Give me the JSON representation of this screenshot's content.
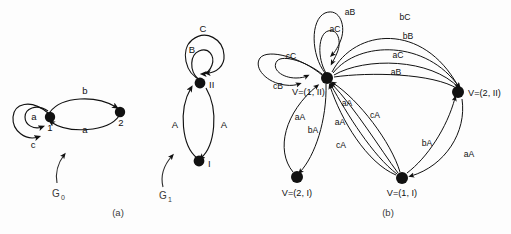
{
  "figure": {
    "background_color": "#fdfdfd",
    "ink_color": "#111111",
    "panels": [
      {
        "id": "a",
        "caption": "(a)"
      },
      {
        "id": "b",
        "caption": "(b)"
      }
    ]
  },
  "panel_a": {
    "caption": "(a)",
    "graphs": [
      {
        "name": "G",
        "subscript": "0",
        "pointer_label": "G0",
        "nodes": [
          {
            "id": "n1",
            "label": "1"
          },
          {
            "id": "n2",
            "label": "2"
          }
        ],
        "edges": [
          {
            "from": "n1",
            "to": "n1",
            "label": "a",
            "kind": "self-loop-inner"
          },
          {
            "from": "n1",
            "to": "n1",
            "label": "c",
            "kind": "self-loop-outer"
          },
          {
            "from": "n1",
            "to": "n2",
            "label": "b",
            "kind": "arc-upper"
          },
          {
            "from": "n2",
            "to": "n1",
            "label": "a",
            "kind": "arc-lower"
          }
        ]
      },
      {
        "name": "G",
        "subscript": "1",
        "pointer_label": "G1",
        "nodes": [
          {
            "id": "nII",
            "label": "II"
          },
          {
            "id": "nI",
            "label": "I"
          }
        ],
        "edges": [
          {
            "from": "nII",
            "to": "nII",
            "label": "C",
            "kind": "self-loop-outer"
          },
          {
            "from": "nII",
            "to": "nII",
            "label": "B",
            "kind": "self-loop-inner"
          },
          {
            "from": "nI",
            "to": "nII",
            "label": "A",
            "kind": "arc-left"
          },
          {
            "from": "nII",
            "to": "nI",
            "label": "A",
            "kind": "arc-right"
          }
        ]
      }
    ]
  },
  "panel_b": {
    "caption": "(b)",
    "nodes": [
      {
        "id": "v1II",
        "label": "V=(1, II)"
      },
      {
        "id": "v2II",
        "label": "V=(2, II)"
      },
      {
        "id": "v2I",
        "label": "V=(2, I)"
      },
      {
        "id": "v1I",
        "label": "V=(1, I)"
      }
    ],
    "edges": [
      {
        "from": "v1II",
        "to": "v1II",
        "label": "aB",
        "kind": "self-loop-up-outer"
      },
      {
        "from": "v1II",
        "to": "v1II",
        "label": "aC",
        "kind": "self-loop-up-inner"
      },
      {
        "from": "v1II",
        "to": "v1II",
        "label": "cC",
        "kind": "self-loop-left-inner"
      },
      {
        "from": "v1II",
        "to": "v1II",
        "label": "cB",
        "kind": "self-loop-left-outer"
      },
      {
        "from": "v1II",
        "to": "v2II",
        "label": "bC",
        "kind": "arc-top"
      },
      {
        "from": "v1II",
        "to": "v2II",
        "label": "bB",
        "kind": "arc-upper"
      },
      {
        "from": "v1II",
        "to": "v2II",
        "label": "aC",
        "kind": "arc-mid"
      },
      {
        "from": "v1II",
        "to": "v2II",
        "label": "aB",
        "kind": "arc-lower"
      },
      {
        "from": "v2I",
        "to": "v1II",
        "label": "aA",
        "kind": "arc-left-up"
      },
      {
        "from": "v1II",
        "to": "v2I",
        "label": "bA",
        "kind": "arc-left-down"
      },
      {
        "from": "v1I",
        "to": "v1II",
        "label": "aA",
        "kind": "arc-center-a"
      },
      {
        "from": "v1I",
        "to": "v1II",
        "label": "aA",
        "kind": "arc-center-b"
      },
      {
        "from": "v1I",
        "to": "v1II",
        "label": "cA",
        "kind": "arc-center-c"
      },
      {
        "from": "v1I",
        "to": "v1II",
        "label": "cA",
        "kind": "arc-center-d"
      },
      {
        "from": "v1I",
        "to": "v2II",
        "label": "bA",
        "kind": "arc-right-inner"
      },
      {
        "from": "v1I",
        "to": "v2II",
        "label": "aA",
        "kind": "arc-right-outer"
      }
    ]
  }
}
